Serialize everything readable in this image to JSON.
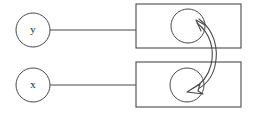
{
  "diagram": {
    "title": "",
    "background_color": "#ffffff",
    "stroke_color": "#4a4a4a",
    "text_color": "#2a2a2a",
    "nodes": [
      {
        "id": "node-y",
        "label": "y",
        "shape": "circle",
        "cx": 33,
        "cy": 30,
        "r": 17
      },
      {
        "id": "node-x",
        "label": "x",
        "shape": "circle",
        "cx": 33,
        "cy": 85,
        "r": 17
      }
    ],
    "containers": [
      {
        "id": "box-top",
        "label": "",
        "shape": "rectangle",
        "x": 136,
        "y": 4,
        "width": 105,
        "height": 44,
        "inner_circle": {
          "id": "inner-circle-top",
          "cx": 188,
          "cy": 26,
          "r": 17,
          "label": ""
        }
      },
      {
        "id": "box-bottom",
        "label": "",
        "shape": "rectangle",
        "x": 136,
        "y": 62,
        "width": 105,
        "height": 45,
        "inner_circle": {
          "id": "inner-circle-bottom",
          "cx": 187,
          "cy": 85,
          "r": 17,
          "label": ""
        }
      }
    ],
    "connectors": [
      {
        "id": "edge-y-to-box-top",
        "type": "line",
        "from": "node-y",
        "to": "box-top",
        "x1": 50,
        "y1": 30,
        "x2": 136,
        "y2": 30,
        "arrowheads": "none"
      },
      {
        "id": "edge-x-to-box-bottom",
        "type": "line",
        "from": "node-x",
        "to": "box-bottom",
        "x1": 50,
        "y1": 85,
        "x2": 136,
        "y2": 85,
        "arrowheads": "none"
      },
      {
        "id": "edge-inner-circles-curved",
        "type": "curve",
        "from": "inner-circle-top",
        "to": "inner-circle-bottom",
        "arrowheads": "both",
        "arrow_style": "open",
        "bulge_direction": "right",
        "label": ""
      }
    ]
  }
}
